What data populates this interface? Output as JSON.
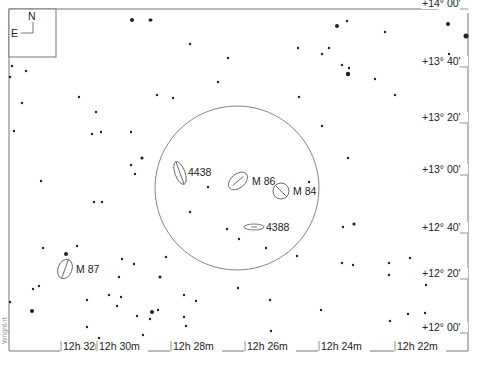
{
  "chart_data": {
    "type": "scatter",
    "compass": {
      "north_label": "N",
      "east_label": "E"
    },
    "ra_axis": {
      "labels": [
        "12h 32m",
        "12h 30m",
        "12h 28m",
        "12h 26m",
        "12h 24m",
        "12h 22m"
      ],
      "x": [
        60,
        96,
        170,
        244,
        318,
        394
      ]
    },
    "dec_axis": {
      "labels": [
        "+14° 00'",
        "+13° 40'",
        "+13° 20'",
        "+13° 00'",
        "+12° 40'",
        "+12° 20'",
        "+12° 00'"
      ],
      "y": [
        6,
        64,
        120,
        172,
        230,
        276,
        330
      ]
    },
    "field_of_view_circle": {
      "cx": 237,
      "cy": 188,
      "r": 82
    },
    "galaxies": [
      {
        "name": "4438",
        "cx": 180,
        "cy": 173,
        "rx": 5,
        "ry": 12,
        "rotate": -20,
        "label_x": 188,
        "label_y": 176
      },
      {
        "name": "M 86",
        "cx": 238,
        "cy": 181,
        "rx": 11,
        "ry": 7,
        "rotate": -40,
        "label_x": 252,
        "label_y": 185
      },
      {
        "name": "M 84",
        "cx": 281,
        "cy": 191,
        "rx": 8,
        "ry": 8,
        "rotate": -45,
        "label_x": 293,
        "label_y": 195
      },
      {
        "name": "4388",
        "cx": 254,
        "cy": 227,
        "rx": 10,
        "ry": 3,
        "rotate": 0,
        "label_x": 266,
        "label_y": 231
      },
      {
        "name": "M 87",
        "cx": 65,
        "cy": 269,
        "rx": 7,
        "ry": 10,
        "rotate": 20,
        "label_x": 76,
        "label_y": 273
      }
    ],
    "stars": [
      [
        132,
        20,
        2
      ],
      [
        151,
        20,
        1.5
      ],
      [
        448,
        24,
        2
      ],
      [
        12,
        66,
        1.2
      ],
      [
        26,
        71,
        1.2
      ],
      [
        10,
        77,
        1.2
      ],
      [
        190,
        44,
        1.2
      ],
      [
        228,
        58,
        1.2
      ],
      [
        150,
        20,
        1.5
      ],
      [
        337,
        26,
        2
      ],
      [
        347,
        21,
        1.2
      ],
      [
        298,
        48,
        1.2
      ],
      [
        322,
        54,
        1.2
      ],
      [
        329,
        48,
        1.2
      ],
      [
        342,
        65,
        1.2
      ],
      [
        349,
        68,
        1.2
      ],
      [
        348,
        74,
        2.2
      ],
      [
        375,
        79,
        1.2
      ],
      [
        385,
        32,
        1.2
      ],
      [
        466,
        36,
        2.5
      ],
      [
        449,
        54,
        1.2
      ],
      [
        395,
        95,
        1.2
      ],
      [
        157,
        95,
        1.2
      ],
      [
        173,
        98,
        1.2
      ],
      [
        299,
        97,
        1.2
      ],
      [
        218,
        82,
        1.2
      ],
      [
        22,
        103,
        1.2
      ],
      [
        79,
        97,
        1.2
      ],
      [
        96,
        112,
        1.2
      ],
      [
        92,
        134,
        1.2
      ],
      [
        101,
        132,
        1.2
      ],
      [
        131,
        132,
        1.2
      ],
      [
        142,
        158,
        1.6
      ],
      [
        131,
        165,
        1.2
      ],
      [
        135,
        174,
        1.2
      ],
      [
        14,
        131,
        1.2
      ],
      [
        41,
        181,
        1.2
      ],
      [
        94,
        202,
        1.2
      ],
      [
        102,
        202,
        1.2
      ],
      [
        190,
        212,
        1.2
      ],
      [
        227,
        229,
        1.2
      ],
      [
        239,
        239,
        1.2
      ],
      [
        208,
        187,
        1.2
      ],
      [
        309,
        182,
        1.2
      ],
      [
        322,
        126,
        1.2
      ],
      [
        348,
        158,
        1.2
      ],
      [
        343,
        227,
        1.2
      ],
      [
        342,
        263,
        1.2
      ],
      [
        353,
        265,
        1.2
      ],
      [
        389,
        263,
        1.2
      ],
      [
        354,
        224,
        1.6
      ],
      [
        43,
        248,
        1.2
      ],
      [
        66,
        254,
        2
      ],
      [
        77,
        246,
        1.2
      ],
      [
        33,
        289,
        1.2
      ],
      [
        39,
        286,
        1.2
      ],
      [
        122,
        259,
        1.2
      ],
      [
        134,
        264,
        1.2
      ],
      [
        119,
        277,
        1.2
      ],
      [
        160,
        277,
        1.6
      ],
      [
        166,
        257,
        1.2
      ],
      [
        10,
        302,
        1.2
      ],
      [
        87,
        300,
        1.2
      ],
      [
        109,
        295,
        1.2
      ],
      [
        121,
        297,
        1.2
      ],
      [
        117,
        306,
        1.2
      ],
      [
        184,
        295,
        1.2
      ],
      [
        196,
        301,
        1.2
      ],
      [
        158,
        310,
        1.2
      ],
      [
        184,
        317,
        1.2
      ],
      [
        186,
        326,
        1.2
      ],
      [
        137,
        316,
        1.2
      ],
      [
        152,
        312,
        2
      ],
      [
        238,
        288,
        1.2
      ],
      [
        270,
        300,
        1.2
      ],
      [
        321,
        310,
        1.2
      ],
      [
        32,
        311,
        2
      ],
      [
        87,
        327,
        1.2
      ],
      [
        99,
        338,
        1.2
      ],
      [
        129,
        342,
        1.2
      ],
      [
        143,
        335,
        1.2
      ],
      [
        150,
        319,
        1.2
      ],
      [
        271,
        331,
        1.2
      ],
      [
        389,
        275,
        1.2
      ],
      [
        410,
        258,
        1.2
      ],
      [
        426,
        285,
        1.2
      ],
      [
        425,
        313,
        1.2
      ],
      [
        408,
        314,
        1.2
      ],
      [
        390,
        321,
        1.2
      ],
      [
        297,
        256,
        1.2
      ],
      [
        266,
        248,
        1.2
      ]
    ]
  },
  "credit_text": "Wright-rt"
}
